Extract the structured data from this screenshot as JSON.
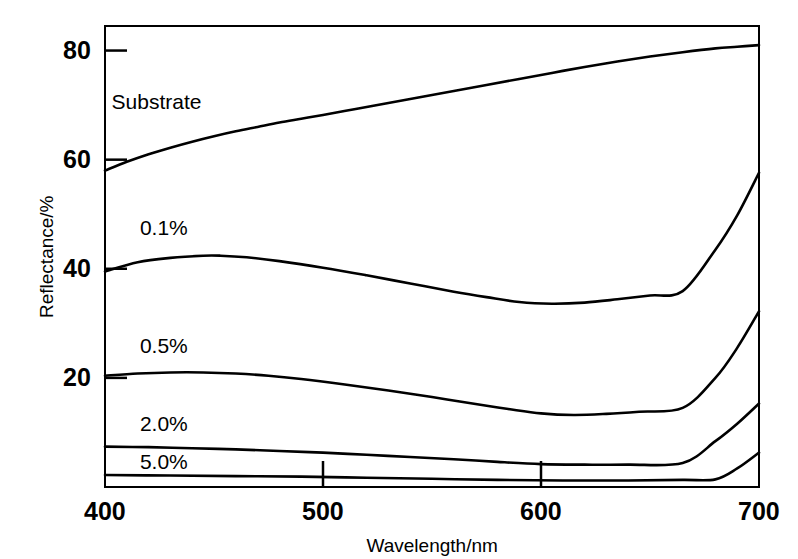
{
  "chart_data": {
    "type": "line",
    "title": "",
    "xlabel": "Wavelength/nm",
    "ylabel": "Reflectance/%",
    "xlim": [
      400,
      700
    ],
    "ylim": [
      0,
      84.5
    ],
    "xticks": [
      400,
      500,
      600,
      700
    ],
    "yticks": [
      20,
      40,
      60,
      80
    ],
    "xtick_labels": [
      "400",
      "500",
      "600",
      "700"
    ],
    "ytick_labels": [
      "20",
      "40",
      "60",
      "80"
    ],
    "grid": false,
    "legend": "inline-labels",
    "line_color": "#000000",
    "background_color": "#ffffff",
    "series": [
      {
        "name": "Substrate",
        "label": "Substrate",
        "x": [
          400,
          410,
          420,
          430,
          440,
          450,
          460,
          470,
          480,
          490,
          500,
          515,
          530,
          545,
          560,
          575,
          590,
          605,
          620,
          635,
          650,
          665,
          680,
          690,
          700
        ],
        "values": [
          58.0,
          59.6,
          61.0,
          62.2,
          63.3,
          64.3,
          65.2,
          66.0,
          66.8,
          67.5,
          68.2,
          69.3,
          70.4,
          71.5,
          72.6,
          73.7,
          74.8,
          75.9,
          77.0,
          78.0,
          78.9,
          79.7,
          80.4,
          80.7,
          81.0
        ]
      },
      {
        "name": "0.1%",
        "label": "0.1%",
        "x": [
          400,
          415,
          430,
          445,
          453,
          465,
          480,
          500,
          520,
          540,
          560,
          575,
          590,
          605,
          620,
          635,
          650,
          665,
          680,
          690,
          700
        ],
        "values": [
          39.5,
          41.2,
          42.0,
          42.4,
          42.4,
          42.1,
          41.4,
          40.2,
          38.8,
          37.3,
          35.8,
          34.8,
          33.9,
          33.6,
          33.8,
          34.4,
          35.1,
          35.9,
          43.5,
          49.8,
          57.6
        ]
      },
      {
        "name": "0.5%",
        "label": "0.5%",
        "x": [
          400,
          415,
          430,
          445,
          460,
          475,
          490,
          510,
          530,
          550,
          570,
          585,
          600,
          615,
          630,
          645,
          665,
          680,
          690,
          700
        ],
        "values": [
          20.4,
          20.8,
          21.0,
          21.0,
          20.8,
          20.4,
          19.8,
          18.8,
          17.7,
          16.5,
          15.2,
          14.3,
          13.5,
          13.2,
          13.4,
          13.8,
          14.5,
          20.0,
          25.5,
          32.2
        ]
      },
      {
        "name": "2.0%",
        "label": "2.0%",
        "x": [
          400,
          420,
          440,
          460,
          480,
          500,
          520,
          540,
          560,
          580,
          600,
          620,
          640,
          665,
          680,
          690,
          700
        ],
        "values": [
          7.4,
          7.3,
          7.1,
          6.9,
          6.6,
          6.3,
          5.9,
          5.5,
          5.1,
          4.6,
          4.2,
          4.1,
          4.1,
          4.4,
          8.4,
          11.6,
          15.3
        ]
      },
      {
        "name": "5.0%",
        "label": "5.0%",
        "x": [
          400,
          430,
          460,
          490,
          520,
          550,
          580,
          610,
          640,
          665,
          680,
          690,
          700
        ],
        "values": [
          2.2,
          2.1,
          2.0,
          1.9,
          1.7,
          1.5,
          1.3,
          1.2,
          1.2,
          1.3,
          1.4,
          3.4,
          6.3
        ]
      }
    ],
    "series_label_positions": [
      {
        "name": "Substrate",
        "x": 403,
        "y": 70.5
      },
      {
        "name": "0.1%",
        "x": 416,
        "y": 47.5
      },
      {
        "name": "0.5%",
        "x": 416,
        "y": 25.8
      },
      {
        "name": "2.0%",
        "x": 416,
        "y": 11.5
      },
      {
        "name": "5.0%",
        "x": 416,
        "y": 4.6
      }
    ]
  }
}
